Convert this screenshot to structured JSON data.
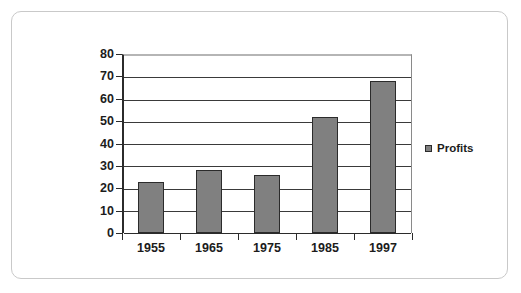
{
  "chart_data": {
    "type": "bar",
    "title": "",
    "xlabel": "",
    "ylabel": "",
    "categories": [
      "1955",
      "1965",
      "1975",
      "1985",
      "1997"
    ],
    "values": [
      23,
      28,
      26,
      52,
      68
    ],
    "series": [
      {
        "name": "Profits",
        "values": [
          23,
          28,
          26,
          52,
          68
        ]
      }
    ],
    "ylim": [
      0,
      80
    ],
    "ytick_labels": [
      "0",
      "10",
      "20",
      "30",
      "40",
      "50",
      "60",
      "70",
      "80"
    ],
    "ytick_values": [
      0,
      10,
      20,
      30,
      40,
      50,
      60,
      70,
      80
    ],
    "grid": "horizontal",
    "legend_position": "right",
    "legend": [
      {
        "label": "Profits",
        "color": "#808080"
      }
    ],
    "colors": {
      "bar_fill": "#808080",
      "bar_border": "#2b2b2b",
      "gridline": "#3a3a3a",
      "axis": "#2b2b2b",
      "frame": "#c9c9c9",
      "text": "#1c1c1c",
      "background": "#ffffff"
    }
  }
}
